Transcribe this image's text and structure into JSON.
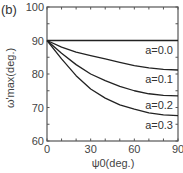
{
  "panel_label": "(b)",
  "chart_data": {
    "type": "line",
    "title": "",
    "xlabel": "ψ0(deg.)",
    "ylabel": "ω'max(deg.)",
    "xlim": [
      0,
      90
    ],
    "ylim": [
      60,
      100
    ],
    "xticks": [
      0,
      30,
      60,
      90
    ],
    "yticks": [
      60,
      70,
      80,
      90,
      100
    ],
    "grid": false,
    "legend_position": "inline-right",
    "x": [
      0,
      10,
      20,
      30,
      40,
      50,
      60,
      70,
      80,
      90
    ],
    "series": [
      {
        "name": "a=0.0",
        "values": [
          90,
          90,
          90,
          90,
          90,
          90,
          90,
          90,
          90,
          90
        ]
      },
      {
        "name": "a=0.1",
        "values": [
          90,
          88.0,
          86.5,
          85.5,
          84.5,
          83.5,
          82.5,
          81.8,
          81.4,
          81.2
        ]
      },
      {
        "name": "a=0.2",
        "values": [
          90,
          86.2,
          82.8,
          80.0,
          78.0,
          76.3,
          75.0,
          74.1,
          73.6,
          73.5
        ]
      },
      {
        "name": "a=0.3",
        "values": [
          90,
          84.5,
          79.5,
          75.5,
          72.8,
          70.8,
          69.5,
          68.4,
          67.8,
          67.6
        ]
      }
    ]
  },
  "labels": {
    "xlabel": "ψ0(deg.)",
    "ylabel": "ω'max(deg.)"
  }
}
